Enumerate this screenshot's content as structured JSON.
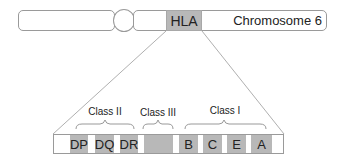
{
  "diagram": {
    "chromosome": {
      "label": "Chromosome 6",
      "region_label": "HLA"
    },
    "classes": [
      {
        "label": "Class II",
        "genes": [
          "DP",
          "DQ",
          "DR"
        ]
      },
      {
        "label": "Class III",
        "genes": [
          ""
        ]
      },
      {
        "label": "Class I",
        "genes": [
          "B",
          "C",
          "E",
          "A"
        ]
      }
    ],
    "genes": {
      "dp": "DP",
      "dq": "DQ",
      "dr": "DR",
      "class3": "",
      "b": "B",
      "c": "C",
      "e": "E",
      "a": "A"
    },
    "colors": {
      "gene_fill": "#b8b8b8",
      "outline": "#9a9a9a",
      "background": "#ffffff"
    }
  }
}
